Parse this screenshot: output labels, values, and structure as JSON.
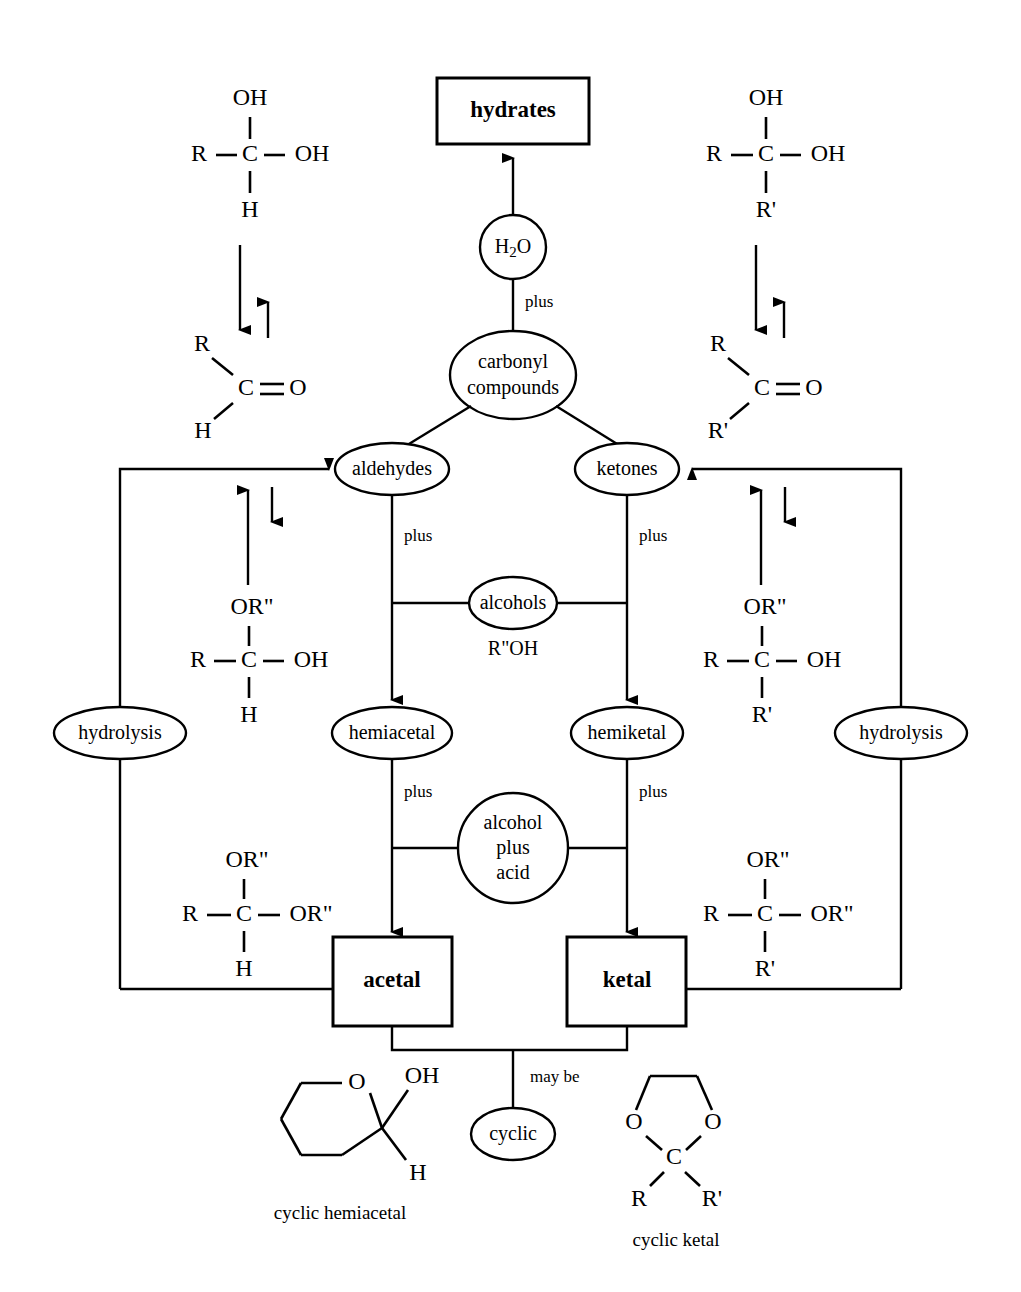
{
  "diagram": {
    "colors": {
      "ink": "#000000",
      "paper": "#ffffff"
    },
    "nodes": {
      "hydrates": "hydrates",
      "water": "H2O",
      "water_main": "H",
      "water_sub": "2",
      "water_tail": "O",
      "carbonyl_line1": "carbonyl",
      "carbonyl_line2": "compounds",
      "aldehydes": "aldehydes",
      "ketones": "ketones",
      "alcohols": "alcohols",
      "alcohols_formula": "R\"OH",
      "hemiacetal": "hemiacetal",
      "hemiketal": "hemiketal",
      "acid_line1": "alcohol",
      "acid_line2": "plus",
      "acid_line3": "acid",
      "acetal": "acetal",
      "ketal": "ketal",
      "cyclic": "cyclic",
      "hydrolysis_left": "hydrolysis",
      "hydrolysis_right": "hydrolysis"
    },
    "edge_labels": {
      "water_plus": "plus",
      "aldehyde_plus": "plus",
      "ketone_plus": "plus",
      "hemiacetal_plus": "plus",
      "hemiketal_plus": "plus",
      "may_be": "may be"
    },
    "structures": {
      "aldehyde_hydrate": {
        "top": "OH",
        "left": "R",
        "center": "C",
        "right": "OH",
        "bottom": "H"
      },
      "aldehyde_carbonyl": {
        "upper": "R",
        "center": "C",
        "right": "O",
        "lower": "H"
      },
      "ketone_hydrate": {
        "top": "OH",
        "left": "R",
        "center": "C",
        "right": "OH",
        "bottom": "R'"
      },
      "ketone_carbonyl": {
        "upper": "R",
        "center": "C",
        "right": "O",
        "lower": "R'"
      },
      "hemiacetal_structure": {
        "top": "OR\"",
        "left": "R",
        "center": "C",
        "right": "OH",
        "bottom": "H"
      },
      "acetal_structure": {
        "top": "OR\"",
        "left": "R",
        "center": "C",
        "right": "OR\"",
        "bottom": "H"
      },
      "hemiketal_structure": {
        "top": "OR\"",
        "left": "R",
        "center": "C",
        "right": "OH",
        "bottom": "R'"
      },
      "ketal_structure": {
        "top": "OR\"",
        "left": "R",
        "center": "C",
        "right": "OR\"",
        "bottom": "R'"
      },
      "cyclic_hemiacetal": {
        "ring_oxygen": "O",
        "substituent_top": "OH",
        "substituent_bottom": "H",
        "caption": "cyclic hemiacetal"
      },
      "cyclic_ketal": {
        "oxygen_left": "O",
        "oxygen_right": "O",
        "center": "C",
        "substituent_left": "R",
        "substituent_right": "R'",
        "caption": "cyclic ketal"
      }
    }
  }
}
